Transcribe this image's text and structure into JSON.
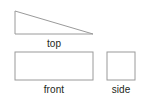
{
  "figure": {
    "background_color": "#ffffff",
    "stroke_color": "#9a9a9a",
    "text_color": "#231f20",
    "stroke_width": 1,
    "views": [
      {
        "id": "top",
        "label": "top",
        "shape": "right-triangle",
        "description": "right triangle with vertical left leg, horizontal bottom leg, hypotenuse from top-left to bottom-right",
        "points": "3,3 3,26 81,26",
        "width_px": 78,
        "height_px": 23
      },
      {
        "id": "front",
        "label": "front",
        "shape": "rectangle",
        "description": "wide rectangle",
        "x": 3,
        "y": 3,
        "width_px": 78,
        "height_px": 28
      },
      {
        "id": "side",
        "label": "side",
        "shape": "rectangle",
        "description": "square",
        "x": 3,
        "y": 3,
        "width_px": 28,
        "height_px": 28
      }
    ]
  }
}
